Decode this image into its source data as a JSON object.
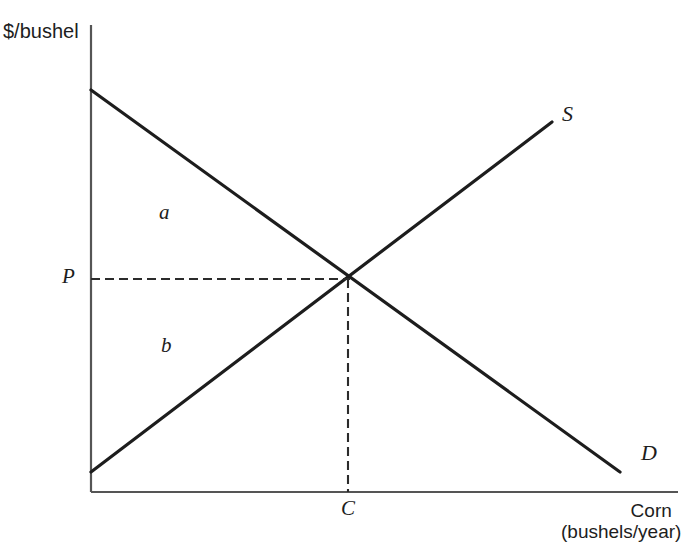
{
  "figure": {
    "width": 691,
    "height": 556,
    "background": "#ffffff",
    "line_color": "#1d1d1d",
    "axis_color": "#4a4a4a"
  },
  "axes": {
    "y_title": "$/bushel",
    "x_title_line1": "Corn",
    "x_title_line2": "(bushels/year)",
    "origin_px": [
      91,
      492
    ],
    "y_top_px": 25,
    "x_right_px": 678
  },
  "labels": {
    "supply": "S",
    "demand": "D",
    "region_upper": "a",
    "region_lower": "b",
    "price": "P",
    "quantity": "C"
  },
  "chart_data": {
    "type": "line",
    "title": "",
    "xlabel": "Corn (bushels/year)",
    "ylabel": "$/bushel",
    "grid": false,
    "legend": "inline-curve-labels",
    "axis_ticks": {
      "x": [
        "C"
      ],
      "y": [
        "P"
      ]
    },
    "series": [
      {
        "name": "D",
        "label": "D",
        "description": "Demand curve, downward sloping",
        "style": "solid",
        "points_px": [
          [
            91,
            90
          ],
          [
            620,
            472
          ]
        ]
      },
      {
        "name": "S",
        "label": "S",
        "description": "Supply curve, upward sloping",
        "style": "solid",
        "points_px": [
          [
            91,
            472
          ],
          [
            552,
            122
          ]
        ]
      }
    ],
    "equilibrium": {
      "label_price": "P",
      "label_quantity": "C",
      "point_px": [
        348,
        279
      ],
      "guides": [
        {
          "name": "price-guide",
          "orientation": "horizontal",
          "style": "dashed",
          "from_px": [
            91,
            279
          ],
          "to_px": [
            348,
            279
          ]
        },
        {
          "name": "quantity-guide",
          "orientation": "vertical",
          "style": "dashed",
          "from_px": [
            348,
            279
          ],
          "to_px": [
            348,
            492
          ]
        }
      ]
    },
    "annotations": [
      {
        "name": "region-a",
        "text": "a",
        "position_px": [
          165,
          215
        ],
        "description": "consumer surplus region above price line"
      },
      {
        "name": "region-b",
        "text": "b",
        "position_px": [
          168,
          348
        ],
        "description": "producer surplus region below price line"
      }
    ]
  }
}
